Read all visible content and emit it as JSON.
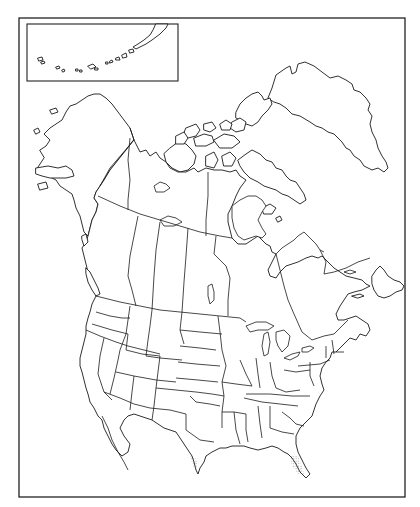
{
  "map": {
    "title": "North America outline map",
    "type": "blank political outline",
    "style": {
      "line_color": "#1a1a1a",
      "background": "#ffffff",
      "stipple_color": "#555555"
    },
    "frame": {
      "x": 19,
      "y": 18,
      "width": 386,
      "height": 479
    },
    "inset": {
      "label": "Aleutian Islands inset",
      "x": 28,
      "y": 24,
      "width": 150,
      "height": 57
    },
    "regions": [
      "Alaska",
      "Yukon",
      "Northwest Territories",
      "Nunavut",
      "British Columbia",
      "Alberta",
      "Saskatchewan",
      "Manitoba",
      "Ontario",
      "Quebec",
      "Newfoundland and Labrador",
      "New Brunswick",
      "Nova Scotia",
      "Prince Edward Island",
      "Greenland",
      "Contiguous United States (48 states)",
      "Mexico (northern)",
      "Baja California"
    ],
    "stippled_areas": [
      "South Texas coast",
      "South Florida"
    ]
  }
}
